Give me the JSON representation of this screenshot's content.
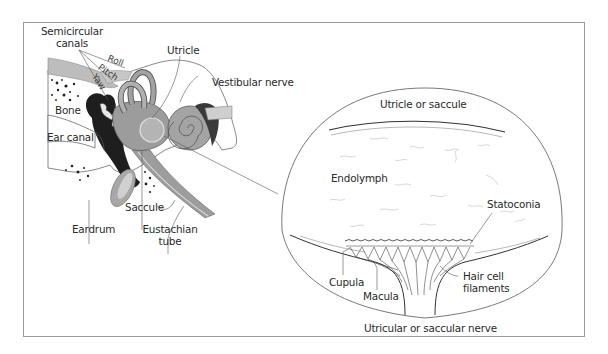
{
  "figure": {
    "panel_left": {
      "title": "Inner ear anatomy",
      "labels": {
        "semicircular_canals_line1": "Semicircular",
        "semicircular_canals_line2": "canals",
        "roll": "Roll",
        "pitch": "Pitch",
        "yaw": "Yaw",
        "utricle": "Utricle",
        "vestibular_nerve": "Vestibular nerve",
        "bone": "Bone",
        "ear_canal": "Ear canal",
        "eardrum": "Eardrum",
        "saccule": "Saccule",
        "eustachian_tube_line1": "Eustachian",
        "eustachian_tube_line2": "tube"
      }
    },
    "panel_right": {
      "title": "Magnified otolith organ",
      "labels": {
        "utricle_or_saccule": "Utricle or saccule",
        "endolymph": "Endolymph",
        "statoconia": "Statoconia",
        "cupula": "Cupula",
        "macula": "Macula",
        "hair_cell_line1": "Hair cell",
        "hair_cell_line2": "filaments",
        "nerve": "Utricular or saccular nerve"
      }
    },
    "colors": {
      "frame": "#9a9a9a",
      "bone_gray": "#b9b9b9",
      "dark_tissue": "#1e1e1e",
      "labyrinth_gray": "#9c9c9c",
      "line": "#444444"
    }
  }
}
